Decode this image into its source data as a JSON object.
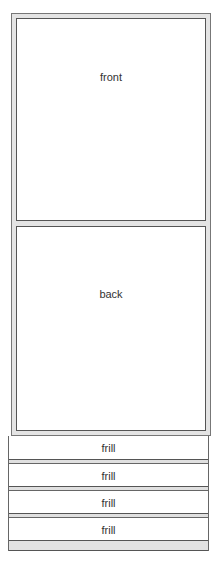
{
  "diagram": {
    "panels": [
      {
        "id": "front",
        "label": "front"
      },
      {
        "id": "back",
        "label": "back"
      }
    ],
    "frills": [
      {
        "label": "frill"
      },
      {
        "label": "frill"
      },
      {
        "label": "frill"
      },
      {
        "label": "frill"
      }
    ]
  }
}
